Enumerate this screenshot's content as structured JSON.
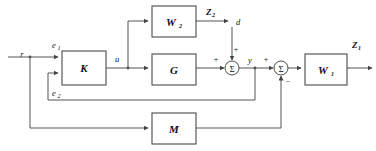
{
  "diagram": {
    "type": "control-system-block-diagram",
    "background_color": "#ffffff",
    "line_color": "#555555",
    "box_stroke_color": "#4a4a4a",
    "text_color": "#111111",
    "blocks": [
      {
        "id": "K",
        "label": "K",
        "x": 62,
        "y": 51,
        "w": 44,
        "h": 34
      },
      {
        "id": "W2",
        "label": "W",
        "sub": "2",
        "x": 152,
        "y": 6,
        "w": 44,
        "h": 31
      },
      {
        "id": "G",
        "label": "G",
        "x": 152,
        "y": 54,
        "w": 44,
        "h": 31
      },
      {
        "id": "M",
        "label": "M",
        "x": 152,
        "y": 113,
        "w": 44,
        "h": 31
      },
      {
        "id": "W1",
        "label": "W",
        "sub": "1",
        "x": 305,
        "y": 54,
        "w": 42,
        "h": 31
      }
    ],
    "summers": [
      {
        "id": "sum1",
        "symbol": "Σ",
        "cx": 232,
        "cy": 68,
        "r": 7
      },
      {
        "id": "sum2",
        "symbol": "Σ",
        "cx": 281,
        "cy": 68,
        "r": 7
      }
    ],
    "signals": [
      {
        "id": "r",
        "label": "r",
        "sub": "",
        "x": 22,
        "y": 57
      },
      {
        "id": "e1",
        "label": "e",
        "sub": "1",
        "x": 52,
        "y": 48
      },
      {
        "id": "e2",
        "label": "e",
        "sub": "2",
        "x": 52,
        "y": 96
      },
      {
        "id": "u",
        "label": "u",
        "sub": "",
        "x": 115,
        "y": 62
      },
      {
        "id": "d",
        "label": "d",
        "sub": "",
        "x": 236,
        "y": 25
      },
      {
        "id": "y",
        "label": "y",
        "sub": "",
        "x": 248,
        "y": 63
      },
      {
        "id": "Z2",
        "label": "Z",
        "sub": "2",
        "x": 206,
        "y": 15,
        "bold": true
      },
      {
        "id": "Z1",
        "label": "Z",
        "sub": "1",
        "x": 352,
        "y": 48,
        "bold": true
      }
    ],
    "signs": [
      {
        "id": "sum1-input-left",
        "symbol": "+",
        "x": 216,
        "y": 62
      },
      {
        "id": "sum1-input-top",
        "symbol": "+",
        "x": 236,
        "y": 52
      },
      {
        "id": "sum2-input-left",
        "symbol": "+",
        "x": 266,
        "y": 62
      },
      {
        "id": "sum2-input-bottom",
        "symbol": "−",
        "x": 286,
        "y": 84
      }
    ]
  }
}
